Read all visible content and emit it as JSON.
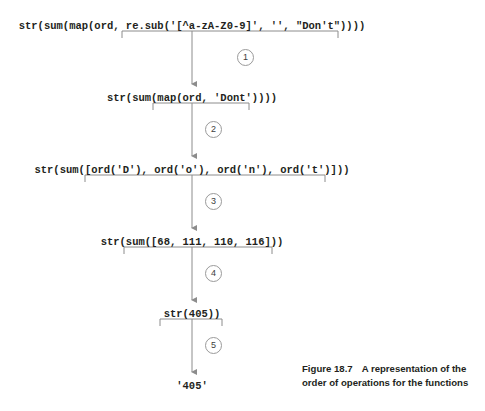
{
  "figure": {
    "caption_label": "Figure 18.7",
    "caption_text": "A representation of the order of operations for the functions",
    "caption_line1": "A representation of the",
    "caption_line2": "order of operations for the functions"
  },
  "diagram": {
    "type": "flow",
    "steps": [
      {
        "number": "1",
        "expression": "str(sum(map(ord, re.sub('[^a-zA-Z0-9]', '', \"Don't\"))))",
        "y": 25,
        "bracket_left": 122,
        "bracket_right": 338
      },
      {
        "number": "2",
        "expression": "str(sum(map(ord, 'Dont'))))",
        "y": 97,
        "bracket_left": 153,
        "bracket_right": 249
      },
      {
        "number": "3",
        "expression": "str(sum([ord('D'), ord('o'), ord('n'), ord('t')]))",
        "y": 169,
        "bracket_left": 85,
        "bracket_right": 325
      },
      {
        "number": "4",
        "expression": "str(sum([68, 111, 110, 116]))",
        "y": 241,
        "bracket_left": 124,
        "bracket_right": 272
      },
      {
        "number": "5",
        "expression": "str(405))",
        "y": 313,
        "bracket_left": 160,
        "bracket_right": 222
      }
    ],
    "result": {
      "expression": "'405'",
      "y": 385
    },
    "center_x": 192,
    "colors": {
      "text": "#231f20",
      "line": "#8c8c8c",
      "circle_border": "#9a9a9a",
      "background": "#ffffff"
    }
  }
}
